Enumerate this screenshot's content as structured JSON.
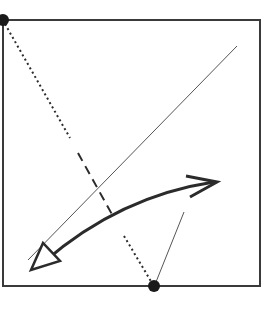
{
  "diagram": {
    "title": "",
    "colors": {
      "frame": "#3a3a3a",
      "line": "#2b2b2b",
      "thin_line": "#555555",
      "dot": "#1a1a1a",
      "background": "#ffffff"
    },
    "frame": {
      "x": 3,
      "y": 20,
      "width": 257,
      "height": 266
    },
    "points": [
      {
        "id": "top-left-dot",
        "x": 3,
        "y": 20,
        "r": 6
      },
      {
        "id": "bottom-dot",
        "x": 154,
        "y": 286,
        "r": 6
      }
    ],
    "lines": [
      {
        "id": "dotted-segment-upper",
        "style": "dotted",
        "x1": 5,
        "y1": 24,
        "x2": 70,
        "y2": 138
      },
      {
        "id": "dashed-segment-middle",
        "style": "dashed",
        "x1": 78,
        "y1": 153,
        "x2": 114,
        "y2": 218
      },
      {
        "id": "dotted-segment-lower",
        "style": "dotted",
        "x1": 124,
        "y1": 236,
        "x2": 152,
        "y2": 283
      },
      {
        "id": "thin-diagonal",
        "style": "solid-thin",
        "x1": 237,
        "y1": 46,
        "x2": 28,
        "y2": 260
      },
      {
        "id": "thin-short-line",
        "style": "solid-thin",
        "x1": 156,
        "y1": 282,
        "x2": 184,
        "y2": 212
      }
    ],
    "curved_arrow": {
      "id": "double-headed-curved-arrow",
      "path": "M 44 262 Q 120 196 214 182",
      "head_start": "hollow-triangle",
      "head_end": "open-chevron"
    }
  }
}
